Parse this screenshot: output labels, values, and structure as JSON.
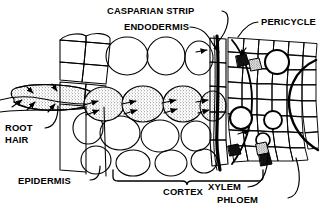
{
  "figure": {
    "background_color": "#ffffff",
    "ink_color": "#000000"
  },
  "labels": {
    "casparian_strip": "CASPARIAN STRIP",
    "endodermis": "ENDODERMIS",
    "pericycle": "PERICYCLE",
    "root": "ROOT",
    "hair": "HAIR",
    "epidermis": "EPIDERMIS",
    "cortex": "CORTEX",
    "xylem": "XYLEM",
    "phloem": "PHLOEM"
  }
}
